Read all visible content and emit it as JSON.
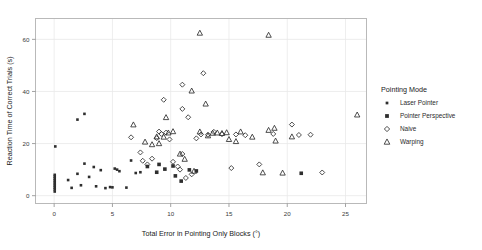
{
  "chart_data": {
    "type": "scatter",
    "title": "",
    "xlabel": "Total Error in Pointing Only Blocks (°)",
    "ylabel": "Reaction Time of Correct Trials (s)",
    "xlim": [
      -1.6,
      26.8
    ],
    "ylim": [
      -3.0,
      68.0
    ],
    "xticks": [
      0,
      5,
      10,
      15,
      20,
      25
    ],
    "xticklabels": [
      "0",
      "5",
      "10",
      "15",
      "20",
      "25"
    ],
    "yticks": [
      0,
      20,
      40,
      60
    ],
    "yticklabels": [
      "0",
      "20",
      "40",
      "60"
    ],
    "grid": true,
    "grid_color": "#e8e8e8",
    "frame_color": "#b9b9b9",
    "marker_color": "#2e2e2e",
    "legend": {
      "title": "Pointing Mode",
      "position": "right",
      "entries": [
        {
          "label": "Laser Pointer",
          "marker": "square-small-filled"
        },
        {
          "label": "Pointer Perspective",
          "marker": "square-filled"
        },
        {
          "label": "Naive",
          "marker": "diamond-open"
        },
        {
          "label": "Warping",
          "marker": "triangle-open"
        }
      ]
    },
    "series": [
      {
        "name": "Laser Pointer",
        "marker": "square-small-filled",
        "points": [
          [
            0.05,
            1.6
          ],
          [
            0.05,
            2.4
          ],
          [
            0.05,
            3.1
          ],
          [
            0.05,
            3.8
          ],
          [
            0.05,
            4.5
          ],
          [
            0.05,
            5.2
          ],
          [
            0.05,
            5.9
          ],
          [
            0.05,
            6.6
          ],
          [
            0.05,
            7.3
          ],
          [
            0.05,
            8.0
          ],
          [
            0.1,
            18.9
          ],
          [
            1.2,
            6.0
          ],
          [
            1.5,
            3.0
          ],
          [
            2.0,
            8.4
          ],
          [
            2.3,
            4.0
          ],
          [
            2.6,
            12.3
          ],
          [
            3.0,
            7.2
          ],
          [
            3.4,
            11.0
          ],
          [
            3.6,
            3.6
          ],
          [
            4.0,
            9.8
          ],
          [
            4.4,
            2.9
          ],
          [
            4.8,
            3.3
          ],
          [
            5.0,
            3.2
          ],
          [
            5.2,
            10.4
          ],
          [
            5.4,
            10.0
          ],
          [
            5.6,
            9.4
          ],
          [
            6.2,
            3.1
          ],
          [
            6.6,
            13.5
          ],
          [
            7.0,
            8.7
          ],
          [
            7.4,
            9.0
          ],
          [
            2.0,
            29.2
          ],
          [
            2.6,
            31.4
          ]
        ]
      },
      {
        "name": "Pointer Perspective",
        "marker": "square-filled",
        "points": [
          [
            8.0,
            11.2
          ],
          [
            8.8,
            9.0
          ],
          [
            9.5,
            10.2
          ],
          [
            10.4,
            7.6
          ],
          [
            10.9,
            5.6
          ],
          [
            11.6,
            9.9
          ],
          [
            12.2,
            9.5
          ],
          [
            21.2,
            8.6
          ],
          [
            9.0,
            12.0
          ],
          [
            10.2,
            11.4
          ]
        ]
      },
      {
        "name": "Naive",
        "marker": "diamond-open",
        "points": [
          [
            6.6,
            22.4
          ],
          [
            7.6,
            13.4
          ],
          [
            8.0,
            12.0
          ],
          [
            8.4,
            14.2
          ],
          [
            8.8,
            22.1
          ],
          [
            9.0,
            24.6
          ],
          [
            9.2,
            23.7
          ],
          [
            9.6,
            24.2
          ],
          [
            9.9,
            21.6
          ],
          [
            10.2,
            13.0
          ],
          [
            10.6,
            11.2
          ],
          [
            10.8,
            10.0
          ],
          [
            11.0,
            16.0
          ],
          [
            11.3,
            6.8
          ],
          [
            11.8,
            8.2
          ],
          [
            12.2,
            22.0
          ],
          [
            12.6,
            23.5
          ],
          [
            13.2,
            23.4
          ],
          [
            13.7,
            24.5
          ],
          [
            14.4,
            23.6
          ],
          [
            15.2,
            10.6
          ],
          [
            15.6,
            23.5
          ],
          [
            16.4,
            23.2
          ],
          [
            17.6,
            12.0
          ],
          [
            18.8,
            23.7
          ],
          [
            20.4,
            27.3
          ],
          [
            21.0,
            23.3
          ],
          [
            22.0,
            23.4
          ],
          [
            23.0,
            8.9
          ],
          [
            9.4,
            36.8
          ],
          [
            11.0,
            33.3
          ],
          [
            12.8,
            47.0
          ],
          [
            11.0,
            42.6
          ],
          [
            11.5,
            30.1
          ],
          [
            7.4,
            16.6
          ]
        ]
      },
      {
        "name": "Warping",
        "marker": "triangle-open",
        "points": [
          [
            6.8,
            27.2
          ],
          [
            7.8,
            20.6
          ],
          [
            8.4,
            19.6
          ],
          [
            8.8,
            22.6
          ],
          [
            9.0,
            20.0
          ],
          [
            9.4,
            22.5
          ],
          [
            9.8,
            24.1
          ],
          [
            10.2,
            24.6
          ],
          [
            10.8,
            16.0
          ],
          [
            11.2,
            14.0
          ],
          [
            12.0,
            9.4
          ],
          [
            12.5,
            24.5
          ],
          [
            13.2,
            23.0
          ],
          [
            14.0,
            24.1
          ],
          [
            14.4,
            23.9
          ],
          [
            14.8,
            24.2
          ],
          [
            15.0,
            21.6
          ],
          [
            15.6,
            20.8
          ],
          [
            17.0,
            22.5
          ],
          [
            17.9,
            8.8
          ],
          [
            18.4,
            25.1
          ],
          [
            18.9,
            25.9
          ],
          [
            19.0,
            21.0
          ],
          [
            19.6,
            8.7
          ],
          [
            20.4,
            22.6
          ],
          [
            11.8,
            40.2
          ],
          [
            12.5,
            62.4
          ],
          [
            18.4,
            61.6
          ],
          [
            26.0,
            31.0
          ],
          [
            13.0,
            35.2
          ],
          [
            9.6,
            30.0
          ],
          [
            13.6,
            24.0
          ],
          [
            16.0,
            24.5
          ]
        ]
      }
    ]
  }
}
